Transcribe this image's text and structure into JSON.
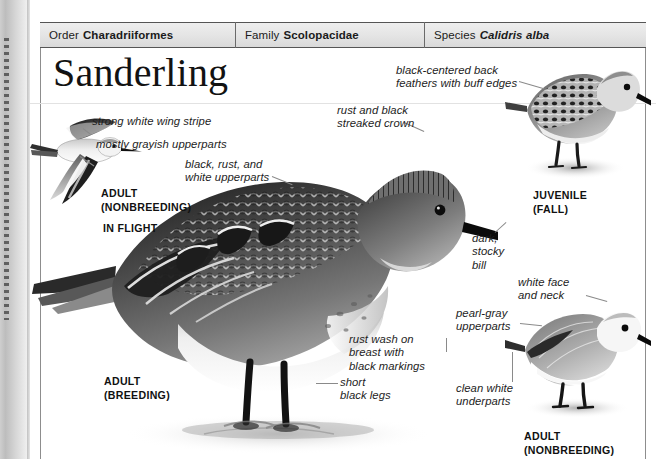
{
  "page": {
    "title": "Sanderling",
    "background_color": "#ffffff",
    "frame_color": "#8d8d8d"
  },
  "header": {
    "background_color": "#e4e4e4",
    "cells": [
      {
        "label": "Order",
        "value": "Charadriiformes",
        "italic": false
      },
      {
        "label": "Family",
        "value": "Scolopacidae",
        "italic": false
      },
      {
        "label": "Species",
        "value": "Calidris alba",
        "italic": true
      }
    ]
  },
  "callouts": [
    {
      "name": "wing-stripe",
      "text": "strong white wing stripe"
    },
    {
      "name": "grayish-upperparts",
      "text": "mostly grayish upperparts"
    },
    {
      "name": "black-rust-white",
      "text": "black, rust, and\nwhite upperparts"
    },
    {
      "name": "streaked-crown",
      "text": "rust and black\nstreaked crown"
    },
    {
      "name": "back-feathers",
      "text": "black-centered back\nfeathers with buff edges"
    },
    {
      "name": "stocky-bill",
      "text": "dark,\nstocky\nbill"
    },
    {
      "name": "white-face-neck",
      "text": "white face\nand neck"
    },
    {
      "name": "pearl-gray",
      "text": "pearl-gray\nupperparts"
    },
    {
      "name": "rust-wash",
      "text": "rust wash on\nbreast with\nblack markings"
    },
    {
      "name": "clean-white",
      "text": "clean white\nunderparts"
    },
    {
      "name": "black-legs",
      "text": "short\nblack legs"
    }
  ],
  "captions": [
    {
      "name": "adult-nonbreeding-flight",
      "text": "ADULT\n(NONBREEDING)"
    },
    {
      "name": "in-flight",
      "text": "IN FLIGHT"
    },
    {
      "name": "juvenile-fall",
      "text": "JUVENILE\n(FALL)"
    },
    {
      "name": "adult-breeding",
      "text": "ADULT\n(BREEDING)"
    },
    {
      "name": "adult-nonbreeding-right",
      "text": "ADULT\n(NONBREEDING)"
    }
  ],
  "illustrations": [
    {
      "name": "sanderling-in-flight",
      "plumage": "nonbreeding"
    },
    {
      "name": "sanderling-adult-breeding-main",
      "plumage": "breeding"
    },
    {
      "name": "sanderling-juvenile",
      "plumage": "juvenile"
    },
    {
      "name": "sanderling-adult-nonbreeding",
      "plumage": "nonbreeding"
    }
  ]
}
